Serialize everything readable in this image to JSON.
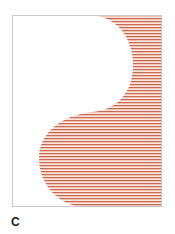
{
  "figure": {
    "panel_label": "C",
    "frame": {
      "x": 12,
      "y": 15,
      "width": 150,
      "height": 192,
      "stroke": "#c8c8c8"
    },
    "fill_pattern": {
      "type": "horizontal-stripes",
      "period_px": 3,
      "dark_color": "#c46a5c",
      "light_color": "#f6c3aa",
      "gap_color": "#fdf1ea"
    },
    "shape": {
      "description": "S-shaped boundary: white region on left, striped region on right",
      "path": "M88,15 C118,15 133,40 133,64 C133,92 118,110 92,112 C58,116 39,135 39,158 C39,186 60,207 86,207 L162,207 L162,15 Z"
    }
  }
}
